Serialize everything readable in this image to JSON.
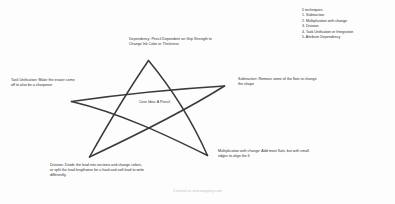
{
  "diagram": {
    "background_color": "#fdfdfd",
    "stroke_color": "#3a3a3a",
    "text_color": "#2e2e2e"
  },
  "techniques": {
    "heading": "5 techniques:",
    "items": [
      "1. Subtraction",
      "2. Multiplication with change",
      "3. Division",
      "4. Task Unification or Integration",
      "5. Attribute Dependency"
    ]
  },
  "labels": {
    "dependency": "Dependency: Pencil Dependent on Grip Strength to Change Ink Color or Thickness",
    "task_unification": "Task Unification: Make the eraser come off to also be a sharpener",
    "subtraction": "Subtraction: Remove some of the flats to change the shape",
    "core_idea": "Core Idea: A Pencil",
    "multiplication": "Multiplication with change: Add more flats, but with small ridges to align the fi",
    "division": "Division: Divide the lead into sections and change colors, or split the lead lengthwise for a hard and soft lead to write differently."
  },
  "watermark": {
    "text": "Created on wisemapping.com"
  },
  "star": {
    "points": [
      {
        "name": "top",
        "x": 148,
        "y": 60
      },
      {
        "name": "right",
        "x": 224,
        "y": 86
      },
      {
        "name": "bottom-right",
        "x": 207,
        "y": 156
      },
      {
        "name": "bottom-left",
        "x": 89,
        "y": 157
      },
      {
        "name": "left",
        "x": 71,
        "y": 101
      }
    ]
  }
}
